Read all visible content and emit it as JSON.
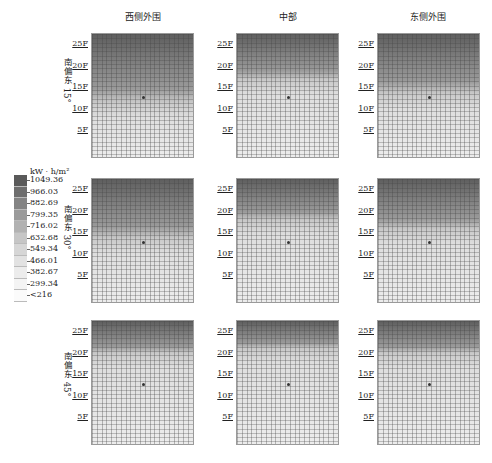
{
  "chart_data": {
    "type": "heatmap",
    "title": "",
    "columns": [
      "西侧外围",
      "中部",
      "东侧外围"
    ],
    "rows": [
      "南偏东 15°",
      "南偏东 30°",
      "南偏东 45°"
    ],
    "y_axis_ticks": [
      "25F",
      "20F",
      "15F",
      "10F",
      "5F"
    ],
    "legend": {
      "unit": "kW · h/m²",
      "levels": [
        "1049.36",
        "966.03",
        "882.69",
        "799.35",
        "716.02",
        "632.68",
        "549.34",
        "466.01",
        "382.67",
        "299.34",
        "<216"
      ],
      "colors": [
        "#5a5a5a",
        "#6e6e6e",
        "#848484",
        "#9b9b9b",
        "#b2b2b2",
        "#c6c6c6",
        "#d6d6d6",
        "#e2e2e2",
        "#ececec",
        "#f4f4f4",
        "#fbfbfb"
      ]
    },
    "panels": [
      {
        "row": "南偏东 15°",
        "column": "西侧外围",
        "dark_band_floor": "12F"
      },
      {
        "row": "南偏东 15°",
        "column": "中部",
        "dark_band_floor": "17F"
      },
      {
        "row": "南偏东 15°",
        "column": "东侧外围",
        "dark_band_floor": "14F"
      },
      {
        "row": "南偏东 30°",
        "column": "西侧外围",
        "dark_band_floor": "14F"
      },
      {
        "row": "南偏东 30°",
        "column": "中部",
        "dark_band_floor": "18F"
      },
      {
        "row": "南偏东 30°",
        "column": "东侧外围",
        "dark_band_floor": "16F"
      },
      {
        "row": "南偏东 45°",
        "column": "西侧外围",
        "dark_band_floor": "20F"
      },
      {
        "row": "南偏东 45°",
        "column": "中部",
        "dark_band_floor": "21F"
      },
      {
        "row": "南偏东 45°",
        "column": "东侧外围",
        "dark_band_floor": "20F"
      }
    ]
  },
  "columns": [
    "西侧外围",
    "中部",
    "东侧外围"
  ],
  "rows": [
    "南偏东 15°",
    "南偏东 30°",
    "南偏东 45°"
  ],
  "floors": [
    "25F",
    "20F",
    "15F",
    "10F",
    "5F"
  ],
  "legend": {
    "unit": "kW · h/m²",
    "labels": [
      "1049.36",
      "966.03",
      "882.69",
      "799.35",
      "716.02",
      "632.68",
      "549.34",
      "466.01",
      "382.67",
      "299.34",
      "<216"
    ]
  }
}
